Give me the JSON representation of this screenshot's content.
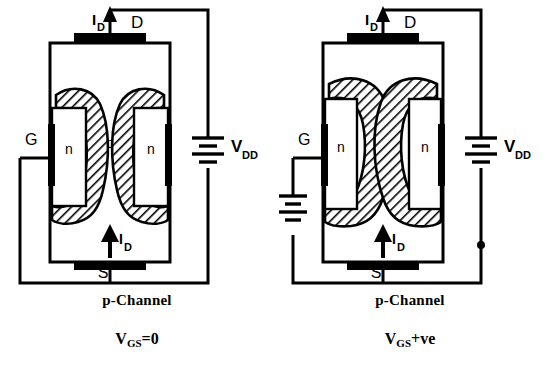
{
  "figure": {
    "title_implicit": "p-Channel JFET operation",
    "panels": [
      {
        "id": "left",
        "caption_line1": "p-Channel",
        "caption_line2_main": "V",
        "caption_line2_sub": "GS",
        "caption_line2_tail": "=0",
        "labels": {
          "drain": "D",
          "source": "S",
          "gate": "G",
          "current_top_main": "I",
          "current_top_sub": "D",
          "current_bottom_main": "I",
          "current_bottom_sub": "D",
          "n_left": "n",
          "n_right": "n",
          "p_body": "p",
          "supply_main": "V",
          "supply_sub": "DD"
        },
        "depletion_state": "narrow",
        "gate_supply_present": false
      },
      {
        "id": "right",
        "caption_line1": "p-Channel",
        "caption_line2_main": "V",
        "caption_line2_sub": "GS",
        "caption_line2_tail": "+ve",
        "labels": {
          "drain": "D",
          "source": "S",
          "gate": "G",
          "current_top_main": "I",
          "current_top_sub": "D",
          "current_bottom_main": "I",
          "current_bottom_sub": "D",
          "n_left": "n",
          "n_right": "n",
          "p_body": "p",
          "supply_main": "V",
          "supply_sub": "DD",
          "gate_supply_main": "V",
          "gate_supply_sub": "GG"
        },
        "depletion_state": "wide",
        "gate_supply_present": true
      }
    ],
    "colors": {
      "ink": "#000000",
      "background": "#ffffff",
      "hatch": "#000000",
      "contact_fill": "#000000"
    }
  }
}
